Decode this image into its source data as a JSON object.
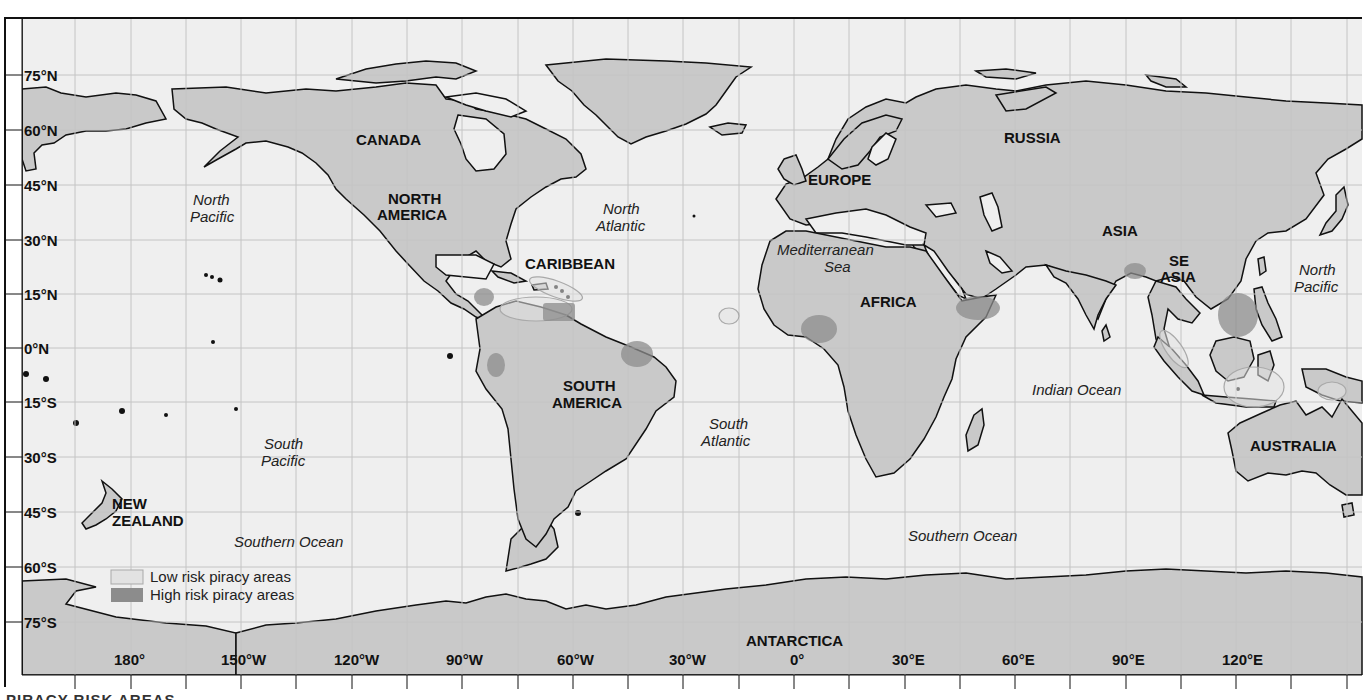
{
  "map": {
    "title_caption": "PIRACY RISK AREAS",
    "colors": {
      "ocean": "#efefef",
      "land": "#c9c9c9",
      "coast": "#111111",
      "grid": "#c4c4c4",
      "low_risk_fill": "#e2e2e2",
      "low_risk_stroke": "#a9a9a9",
      "high_risk_fill": "#8c8c8c",
      "frame": "#111111"
    },
    "latitude_labels": [
      "75°N",
      "60°N",
      "45°N",
      "30°N",
      "15°N",
      "0°N",
      "15°S",
      "30°S",
      "45°S",
      "60°S",
      "75°S"
    ],
    "longitude_labels": [
      "180°",
      "150°W",
      "120°W",
      "90°W",
      "60°W",
      "30°W",
      "0°",
      "30°E",
      "60°E",
      "90°E",
      "120°E"
    ],
    "region_labels": {
      "canada": "CANADA",
      "north_america_1": "NORTH",
      "north_america_2": "AMERICA",
      "caribbean": "CARIBBEAN",
      "south_america_1": "SOUTH",
      "south_america_2": "AMERICA",
      "europe": "EUROPE",
      "russia": "RUSSIA",
      "asia": "ASIA",
      "se_asia_1": "SE",
      "se_asia_2": "ASIA",
      "africa": "AFRICA",
      "australia": "AUSTRALIA",
      "new_zealand_1": "NEW",
      "new_zealand_2": "ZEALAND",
      "antarctica": "ANTARCTICA"
    },
    "ocean_labels": {
      "north_pacific_w_1": "North",
      "north_pacific_w_2": "Pacific",
      "north_atlantic_1": "North",
      "north_atlantic_2": "Atlantic",
      "mediterranean_1": "Mediterranean",
      "mediterranean_2": "Sea",
      "north_pacific_e_1": "North",
      "north_pacific_e_2": "Pacific",
      "south_pacific_1": "South",
      "south_pacific_2": "Pacific",
      "south_atlantic_1": "South",
      "south_atlantic_2": "Atlantic",
      "indian_ocean": "Indian Ocean",
      "southern_ocean_w": "Southern Ocean",
      "southern_ocean_e": "Southern Ocean"
    },
    "legend": {
      "low_risk": "Low risk piracy areas",
      "high_risk": "High risk piracy areas"
    },
    "high_risk_areas": [
      "Central America (Honduras/Nicaragua coast)",
      "Venezuela coast",
      "Ecuador / Peru coast",
      "Northeast Brazil coast",
      "Gulf of Guinea",
      "Gulf of Aden / Somalia",
      "Bay of Bengal (Bangladesh)",
      "South China Sea"
    ],
    "low_risk_areas": [
      "Lesser Antilles",
      "Southern Caribbean",
      "Cape Verde",
      "Strait of Malacca",
      "Indonesian waters",
      "Papua New Guinea"
    ]
  }
}
